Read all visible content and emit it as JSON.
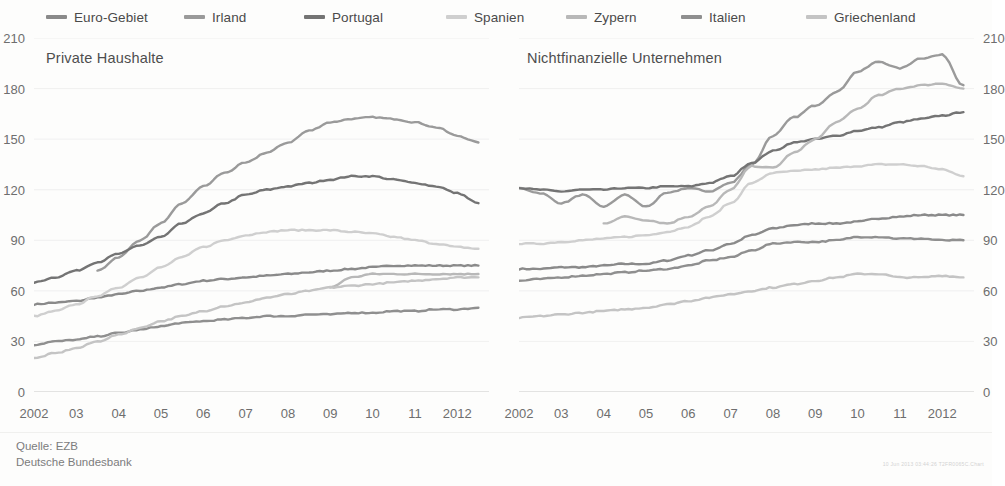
{
  "legend": {
    "items": [
      {
        "label": "Euro-Gebiet",
        "color": "#8a8a8a"
      },
      {
        "label": "Irland",
        "color": "#9a9a9a"
      },
      {
        "label": "Portugal",
        "color": "#747474"
      },
      {
        "label": "Spanien",
        "color": "#cfcfcf"
      },
      {
        "label": "Zypern",
        "color": "#b8b8b8"
      },
      {
        "label": "Italien",
        "color": "#8f8f8f"
      },
      {
        "label": "Griechenland",
        "color": "#c4c4c4"
      }
    ]
  },
  "footer": {
    "source": "Quelle: EZB",
    "publisher": "Deutsche Bundesbank",
    "chart_id": "10 Jun 2013  03:44:26  T2FR0065C.Chart"
  },
  "chart_data": [
    {
      "type": "line",
      "title": "Private Haushalte",
      "panel": "left",
      "xlabel": "",
      "ylabel": "",
      "xlim": [
        2002,
        2012.75
      ],
      "ylim": [
        0,
        210
      ],
      "yticks": [
        0,
        30,
        60,
        90,
        120,
        150,
        180,
        210
      ],
      "xticks": [
        2002,
        2003,
        2004,
        2005,
        2006,
        2007,
        2008,
        2009,
        2010,
        2011,
        2012
      ],
      "xticklabels": [
        "2002",
        "03",
        "04",
        "05",
        "06",
        "07",
        "08",
        "09",
        "10",
        "11",
        "2012"
      ],
      "grid": true,
      "legend_position": "top",
      "x": [
        2002,
        2002.5,
        2003,
        2003.5,
        2004,
        2004.5,
        2005,
        2005.5,
        2006,
        2006.5,
        2007,
        2007.5,
        2008,
        2008.5,
        2009,
        2009.5,
        2010,
        2010.5,
        2011,
        2011.5,
        2012,
        2012.5
      ],
      "series": [
        {
          "name": "Euro-Gebiet",
          "color": "#8a8a8a",
          "values": [
            52,
            53,
            54,
            56,
            58,
            60,
            62,
            64,
            66,
            67,
            68,
            69,
            70,
            71,
            72,
            73,
            74,
            75,
            75,
            75,
            75,
            75
          ]
        },
        {
          "name": "Irland",
          "color": "#9a9a9a",
          "values": [
            null,
            null,
            null,
            72,
            80,
            90,
            100,
            112,
            122,
            130,
            136,
            142,
            148,
            155,
            160,
            162,
            163,
            162,
            160,
            157,
            152,
            148
          ]
        },
        {
          "name": "Portugal",
          "color": "#747474",
          "values": [
            65,
            68,
            72,
            77,
            82,
            87,
            92,
            100,
            106,
            112,
            117,
            120,
            122,
            124,
            126,
            128,
            128,
            126,
            124,
            122,
            118,
            112
          ]
        },
        {
          "name": "Spanien",
          "color": "#cfcfcf",
          "values": [
            45,
            48,
            52,
            57,
            62,
            68,
            74,
            80,
            86,
            90,
            93,
            95,
            96,
            96,
            96,
            95,
            94,
            92,
            90,
            88,
            86,
            85
          ]
        },
        {
          "name": "Zypern",
          "color": "#b8b8b8",
          "values": [
            null,
            null,
            null,
            null,
            null,
            null,
            null,
            null,
            null,
            null,
            null,
            null,
            null,
            null,
            62,
            68,
            70,
            70,
            70,
            70,
            70,
            70
          ]
        },
        {
          "name": "Italien",
          "color": "#8f8f8f",
          "values": [
            28,
            30,
            31,
            33,
            35,
            37,
            39,
            41,
            42,
            43,
            44,
            45,
            45,
            46,
            46,
            47,
            47,
            48,
            48,
            49,
            49,
            50
          ]
        },
        {
          "name": "Griechenland",
          "color": "#c4c4c4",
          "values": [
            20,
            23,
            26,
            30,
            34,
            38,
            42,
            45,
            48,
            51,
            53,
            56,
            58,
            60,
            62,
            63,
            64,
            65,
            66,
            67,
            68,
            68
          ]
        }
      ]
    },
    {
      "type": "line",
      "title": "Nichtfinanzielle Unternehmen",
      "panel": "right",
      "xlabel": "",
      "ylabel": "",
      "xlim": [
        2002,
        2012.75
      ],
      "ylim": [
        0,
        210
      ],
      "yticks": [
        0,
        30,
        60,
        90,
        120,
        150,
        180,
        210
      ],
      "xticks": [
        2002,
        2003,
        2004,
        2005,
        2006,
        2007,
        2008,
        2009,
        2010,
        2011,
        2012
      ],
      "xticklabels": [
        "2002",
        "03",
        "04",
        "05",
        "06",
        "07",
        "08",
        "09",
        "10",
        "11",
        "2012"
      ],
      "grid": true,
      "legend_position": "top",
      "x": [
        2002,
        2002.5,
        2003,
        2003.5,
        2004,
        2004.5,
        2005,
        2005.5,
        2006,
        2006.5,
        2007,
        2007.5,
        2008,
        2008.5,
        2009,
        2009.5,
        2010,
        2010.5,
        2011,
        2011.5,
        2012,
        2012.5
      ],
      "series": [
        {
          "name": "Euro-Gebiet",
          "color": "#8a8a8a",
          "values": [
            73,
            73,
            74,
            74,
            75,
            76,
            76,
            78,
            81,
            84,
            88,
            93,
            97,
            99,
            100,
            100,
            101,
            103,
            104,
            105,
            105,
            105
          ]
        },
        {
          "name": "Irland",
          "color": "#9a9a9a",
          "values": [
            121,
            118,
            112,
            117,
            110,
            117,
            110,
            118,
            121,
            119,
            124,
            135,
            152,
            163,
            170,
            178,
            190,
            196,
            192,
            198,
            200,
            182
          ]
        },
        {
          "name": "Portugal",
          "color": "#747474",
          "values": [
            121,
            120,
            119,
            120,
            120,
            121,
            121,
            122,
            122,
            124,
            128,
            136,
            143,
            148,
            150,
            152,
            155,
            157,
            160,
            162,
            164,
            166
          ]
        },
        {
          "name": "Spanien",
          "color": "#cfcfcf",
          "values": [
            88,
            88,
            89,
            90,
            91,
            92,
            93,
            95,
            98,
            104,
            112,
            124,
            130,
            131,
            132,
            133,
            134,
            135,
            135,
            134,
            132,
            128
          ]
        },
        {
          "name": "Zypern",
          "color": "#b8b8b8",
          "values": [
            null,
            null,
            null,
            null,
            100,
            104,
            102,
            100,
            104,
            110,
            120,
            134,
            133,
            142,
            150,
            160,
            168,
            176,
            180,
            182,
            183,
            180
          ]
        },
        {
          "name": "Italien",
          "color": "#8f8f8f",
          "values": [
            66,
            67,
            68,
            69,
            70,
            71,
            72,
            73,
            75,
            78,
            80,
            84,
            88,
            89,
            89,
            90,
            92,
            92,
            91,
            91,
            90,
            90
          ]
        },
        {
          "name": "Griechenland",
          "color": "#c4c4c4",
          "values": [
            44,
            45,
            46,
            47,
            48,
            49,
            50,
            52,
            54,
            56,
            58,
            60,
            62,
            64,
            66,
            68,
            70,
            70,
            68,
            68,
            69,
            68
          ]
        }
      ]
    }
  ]
}
